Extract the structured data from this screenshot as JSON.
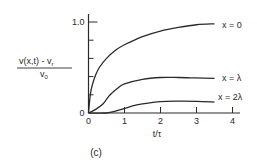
{
  "chart_data": {
    "type": "line",
    "panel_label": "(c)",
    "title": "",
    "xlabel": "t/τ",
    "ylabel": {
      "numerator": "v(x,t) - v",
      "numerator_sub": "r",
      "denominator": "v",
      "denominator_sub": "0"
    },
    "xlim": [
      0,
      4
    ],
    "ylim": [
      0,
      1.0
    ],
    "x_ticks": [
      0,
      1,
      2,
      3,
      4
    ],
    "x_tick_labels": [
      "0",
      "1",
      "2",
      "3",
      "4"
    ],
    "y_ticks": [
      0,
      0.2,
      0.4,
      0.6,
      0.8,
      1.0
    ],
    "y_tick_labels": [
      "0",
      "",
      "",
      "",
      "",
      "1.0"
    ],
    "grid": false,
    "legend": "inline-right",
    "series": [
      {
        "name": "x = 0",
        "x": [
          0,
          0.05,
          0.1,
          0.2,
          0.3,
          0.5,
          0.75,
          1.0,
          1.5,
          2.0,
          2.5,
          3.0,
          3.5
        ],
        "y": [
          0,
          0.2,
          0.3,
          0.42,
          0.5,
          0.6,
          0.69,
          0.75,
          0.84,
          0.9,
          0.94,
          0.97,
          0.98
        ]
      },
      {
        "name": "x = λ",
        "x": [
          0,
          0.2,
          0.4,
          0.5,
          0.6,
          0.8,
          1.0,
          1.5,
          2.0,
          2.5,
          3.0,
          3.5
        ],
        "y": [
          0,
          0.04,
          0.1,
          0.15,
          0.2,
          0.27,
          0.32,
          0.37,
          0.39,
          0.39,
          0.385,
          0.38
        ]
      },
      {
        "name": "x = 2λ",
        "x": [
          0,
          0.5,
          0.75,
          1.0,
          1.25,
          1.5,
          2.0,
          2.5,
          3.0,
          3.5
        ],
        "y": [
          0,
          0,
          0.02,
          0.05,
          0.08,
          0.1,
          0.125,
          0.13,
          0.128,
          0.12
        ]
      }
    ]
  }
}
